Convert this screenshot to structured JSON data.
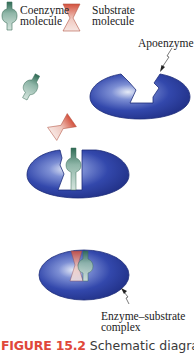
{
  "legend": {
    "coenzyme": {
      "line1": "Coenzyme",
      "line2": "molecule"
    },
    "substrate": {
      "line1": "Substrate",
      "line2": "molecule"
    }
  },
  "labels": {
    "apoenzyme": "Apoenzyme",
    "complex_line1": "Enzyme–substrate",
    "complex_line2": "complex"
  },
  "caption": {
    "figure_number": "FIGURE 15.2",
    "text": "Schematic diagram"
  },
  "colors": {
    "enzyme_blue": "#2a3f9e",
    "coenzyme_green": "#4f8a72",
    "substrate_red": "#d9604c",
    "caption_red": "#e0473a"
  }
}
